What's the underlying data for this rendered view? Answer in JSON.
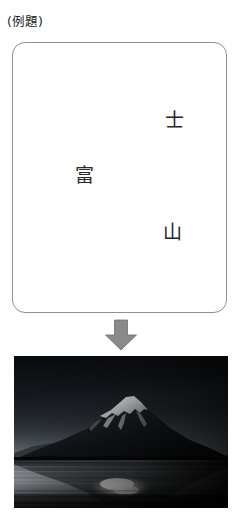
{
  "header": {
    "label": "(例題)"
  },
  "prompt_panel": {
    "name": "scrambled-kanji-panel",
    "border_color": "#8f8f8f",
    "background_color": "#ffffff",
    "tokens": [
      {
        "char": "士",
        "x": 152,
        "y": 68,
        "order": 1
      },
      {
        "char": "富",
        "x": 62,
        "y": 123,
        "order": 2
      },
      {
        "char": "山",
        "x": 150,
        "y": 180,
        "order": 3
      }
    ],
    "answer": "富士山"
  },
  "arrow": {
    "name": "down-arrow",
    "direction": "down",
    "color": "#8a8a8a",
    "outline_color": "#6f6f6f"
  },
  "photo": {
    "name": "mount-fuji-photo",
    "alt": "富士山",
    "palette": {
      "sky_top": "#0b0d11",
      "sky_horizon": "#595f66",
      "mountain_dark": "#15181c",
      "snow_bright": "#f2f2f0",
      "water_light": "#8e9297",
      "water_dark": "#2a2d31",
      "shoreline": "#07080a"
    }
  }
}
